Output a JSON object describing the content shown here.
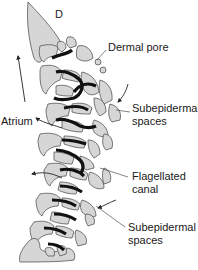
{
  "figure": {
    "panel_letter": "D",
    "labels": {
      "dermal_pore": "Dermal pore",
      "subepidermal_top_line1": "Subepidermal",
      "subepidermal_top_line2": "spaces",
      "atrium": "Atrium",
      "flagellated_line1": "Flagellated",
      "flagellated_line2": "canal",
      "subepidermal_bottom_line1": "Subepidermal",
      "subepidermal_bottom_line2": "spaces"
    },
    "colors": {
      "tissue_fill": "#d6d6d6",
      "tissue_stroke": "#555555",
      "choanocyte_band": "#111111",
      "leader_line": "#333333",
      "background": "#ffffff"
    }
  }
}
